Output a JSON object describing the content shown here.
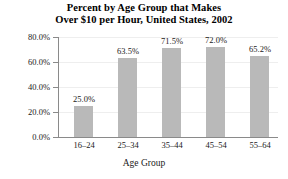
{
  "chart_data": {
    "type": "bar",
    "title": "Percent by Age Group that Makes Over $10 per Hour, United States, 2002",
    "title_line1": "Percent by Age Group that Makes",
    "title_line2": "Over $10 per Hour, United States, 2002",
    "xlabel": "Age Group",
    "ylabel": "",
    "categories": [
      "16–24",
      "25–34",
      "35–44",
      "45–54",
      "55–64"
    ],
    "values": [
      25.0,
      63.5,
      71.5,
      72.0,
      65.2
    ],
    "data_labels": [
      "25.0%",
      "63.5%",
      "71.5%",
      "72.0%",
      "65.2%"
    ],
    "ylim": [
      0,
      80
    ],
    "ytick_values": [
      0,
      20,
      40,
      60,
      80
    ],
    "ytick_labels": [
      "0.0%",
      "20.0%",
      "40.0%",
      "60.0%",
      "80.0%"
    ],
    "grid": true,
    "legend": "none",
    "bar_color": "#b9b9b9",
    "axis_color": "#8a8a8a",
    "gridline_color": "#eeeeee",
    "text_color": "#1a1a1a",
    "background": "#ffffff"
  }
}
